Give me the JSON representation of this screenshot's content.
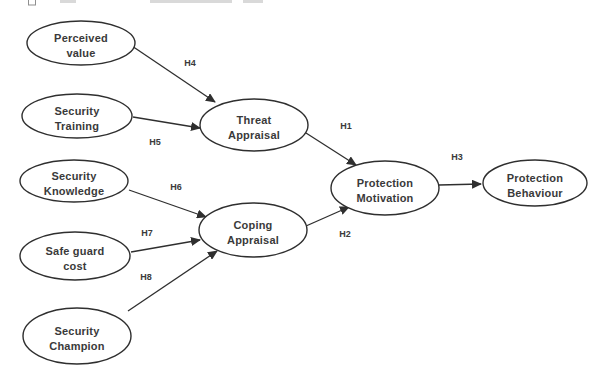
{
  "figure": {
    "background": "#ffffff",
    "stroke_color": "#2f2f2f",
    "text_color": "#3a3a3a",
    "nodes": {
      "perceived_value": {
        "line1": "Perceived",
        "line2": "value"
      },
      "security_training": {
        "line1": "Security",
        "line2": "Training"
      },
      "security_knowledge": {
        "line1": "Security",
        "line2": "Knowledge"
      },
      "safe_guard_cost": {
        "line1": "Safe guard",
        "line2": "cost"
      },
      "security_champion": {
        "line1": "Security",
        "line2": "Champion"
      },
      "threat_appraisal": {
        "line1": "Threat",
        "line2": "Appraisal"
      },
      "coping_appraisal": {
        "line1": "Coping",
        "line2": "Appraisal"
      },
      "protection_motivation": {
        "line1": "Protection",
        "line2": "Motivation"
      },
      "protection_behaviour": {
        "line1": "Protection",
        "line2": "Behaviour"
      }
    },
    "edges": [
      {
        "from": "Perceived value",
        "to": "Threat Appraisal",
        "label": "H4"
      },
      {
        "from": "Security Training",
        "to": "Threat Appraisal",
        "label": "H5"
      },
      {
        "from": "Security Knowledge",
        "to": "Coping Appraisal",
        "label": "H6"
      },
      {
        "from": "Safe guard cost",
        "to": "Coping Appraisal",
        "label": "H7"
      },
      {
        "from": "Security Champion",
        "to": "Coping Appraisal",
        "label": "H8"
      },
      {
        "from": "Threat Appraisal",
        "to": "Protection Motivation",
        "label": "H1"
      },
      {
        "from": "Coping Appraisal",
        "to": "Protection Motivation",
        "label": "H2"
      },
      {
        "from": "Protection Motivation",
        "to": "Protection Behaviour",
        "label": "H3"
      }
    ]
  }
}
